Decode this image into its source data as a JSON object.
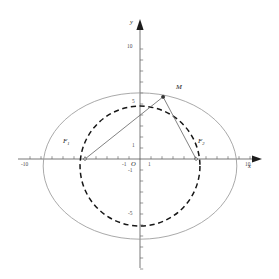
{
  "figure": {
    "background": "#ffffff",
    "curve_color": "#9a9a9a",
    "dashed_color": "#111111",
    "axis_color": "#555555",
    "segment_color": "#666666"
  },
  "axes": {
    "x_label": "x",
    "y_label": "y",
    "origin_label": "O",
    "unit_px": 11.0,
    "origin_px": {
      "x": 140,
      "y": 159
    },
    "x_range": [
      -11,
      11
    ],
    "y_range": [
      -11,
      11
    ],
    "x_ticks": [
      {
        "value": -10,
        "label": "-10"
      },
      {
        "value": -1,
        "label": "-1"
      },
      {
        "value": 1,
        "label": "1"
      },
      {
        "value": 10,
        "label": "10"
      }
    ],
    "y_ticks": [
      {
        "value": 10,
        "label": "10"
      },
      {
        "value": 5,
        "label": "5"
      },
      {
        "value": 1,
        "label": "1"
      },
      {
        "value": -1,
        "label": "-1"
      },
      {
        "value": -5,
        "label": "-5"
      }
    ],
    "x_tick_values": [
      -10,
      -9,
      -8,
      -7,
      -6,
      -5,
      -4,
      -3,
      -2,
      -1,
      1,
      2,
      3,
      4,
      5,
      6,
      7,
      8,
      9,
      10
    ],
    "y_tick_values": [
      10,
      9,
      8,
      7,
      6,
      5,
      4,
      3,
      2,
      1,
      -1,
      -2,
      -3,
      -4,
      -5,
      -6,
      -7,
      -8,
      -9,
      -10
    ]
  },
  "chart_data": {
    "type": "scatter",
    "title": "",
    "xlabel": "x",
    "ylabel": "y",
    "xlim": [
      -11,
      11
    ],
    "ylim": [
      -11,
      11
    ],
    "grid": false,
    "legend": "none",
    "ellipse": {
      "name": "ellipse",
      "center": [
        0,
        -0.64
      ],
      "semi_major_a": 8.8,
      "semi_minor_b": 6.65,
      "style": "solid",
      "color": "#9a9a9a"
    },
    "circle": {
      "name": "dashed-circle",
      "center": [
        0,
        -0.64
      ],
      "radius": 5.45,
      "style": "dashed",
      "color": "#111111"
    },
    "points": [
      {
        "name": "F1",
        "label": "F₁",
        "x": -5.0,
        "y": 0.0
      },
      {
        "name": "F2",
        "label": "F₂",
        "x": 5.1,
        "y": 0.0
      },
      {
        "name": "M",
        "label": "M",
        "x": 2.1,
        "y": 5.65
      }
    ],
    "segments": [
      {
        "name": "F1-M",
        "from": "F1",
        "to": "M"
      },
      {
        "name": "M-F2",
        "from": "M",
        "to": "F2"
      }
    ]
  },
  "labels": {
    "f1": "F",
    "f1_sub": "1",
    "f2": "F",
    "f2_sub": "2",
    "m": "M",
    "origin": "O",
    "x_axis": "x",
    "y_axis": "y",
    "x_neg_ten": "-10",
    "x_pos_ten": "10",
    "x_neg_one": "-1",
    "x_pos_one": "1",
    "y_ten": "10",
    "y_five": "5",
    "y_one": "1",
    "y_neg_one": "-1",
    "y_neg_five": "-5"
  }
}
